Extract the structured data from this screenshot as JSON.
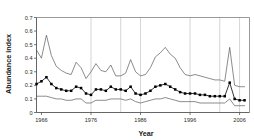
{
  "chart_data": {
    "type": "line",
    "title": "",
    "xlabel": "Year",
    "ylabel": "Abundance index",
    "xlim": [
      1965,
      2008
    ],
    "ylim": [
      0,
      0.7
    ],
    "yticks": [
      0,
      0.1,
      0.2,
      0.3,
      0.4,
      0.5,
      0.6,
      0.7
    ],
    "ytick_labels": [
      "0",
      "0.1",
      "0.2",
      "0.3",
      "0.4",
      "0.5",
      "0.6",
      "0.7"
    ],
    "xticks": [
      1966,
      1976,
      1986,
      1996,
      2006
    ],
    "xtick_labels": [
      "1966",
      "1976",
      "1986",
      "1996",
      "2006"
    ],
    "grid": "vertical-only",
    "gridlines_x": [
      1976,
      1982,
      1986,
      1996,
      2002,
      2006
    ],
    "legend": "none",
    "line_color": "#000000",
    "marker": "square",
    "x": [
      1965,
      1966,
      1967,
      1968,
      1969,
      1970,
      1971,
      1972,
      1973,
      1974,
      1975,
      1976,
      1977,
      1978,
      1979,
      1980,
      1981,
      1982,
      1983,
      1984,
      1985,
      1986,
      1987,
      1988,
      1989,
      1990,
      1991,
      1992,
      1993,
      1994,
      1995,
      1996,
      1997,
      1998,
      1999,
      2000,
      2001,
      2002,
      2003,
      2004,
      2005,
      2006,
      2007
    ],
    "series": [
      {
        "name": "Upper confidence limit",
        "style": "thin-line",
        "values": [
          0.46,
          0.4,
          0.57,
          0.42,
          0.34,
          0.31,
          0.29,
          0.28,
          0.37,
          0.33,
          0.25,
          0.3,
          0.36,
          0.31,
          0.3,
          0.35,
          0.27,
          0.27,
          0.29,
          0.39,
          0.3,
          0.27,
          0.28,
          0.33,
          0.41,
          0.44,
          0.48,
          0.43,
          0.4,
          0.33,
          0.28,
          0.27,
          0.28,
          0.27,
          0.26,
          0.25,
          0.24,
          0.24,
          0.23,
          0.48,
          0.2,
          0.19,
          0.19
        ]
      },
      {
        "name": "Abundance index",
        "style": "line-with-square-markers",
        "values": [
          0.21,
          0.23,
          0.26,
          0.21,
          0.18,
          0.17,
          0.16,
          0.16,
          0.19,
          0.18,
          0.14,
          0.13,
          0.17,
          0.17,
          0.16,
          0.19,
          0.17,
          0.17,
          0.16,
          0.19,
          0.14,
          0.13,
          0.14,
          0.16,
          0.19,
          0.2,
          0.21,
          0.19,
          0.17,
          0.15,
          0.14,
          0.14,
          0.14,
          0.13,
          0.13,
          0.12,
          0.12,
          0.12,
          0.12,
          0.22,
          0.1,
          0.09,
          0.09
        ]
      },
      {
        "name": "Lower confidence limit",
        "style": "thin-line",
        "values": [
          0.12,
          0.12,
          0.12,
          0.11,
          0.1,
          0.1,
          0.09,
          0.09,
          0.1,
          0.1,
          0.07,
          0.07,
          0.09,
          0.09,
          0.09,
          0.1,
          0.1,
          0.1,
          0.09,
          0.1,
          0.08,
          0.07,
          0.08,
          0.09,
          0.1,
          0.1,
          0.11,
          0.1,
          0.09,
          0.08,
          0.08,
          0.08,
          0.08,
          0.07,
          0.07,
          0.07,
          0.07,
          0.07,
          0.07,
          0.1,
          0.05,
          0.05,
          0.05
        ]
      }
    ]
  }
}
